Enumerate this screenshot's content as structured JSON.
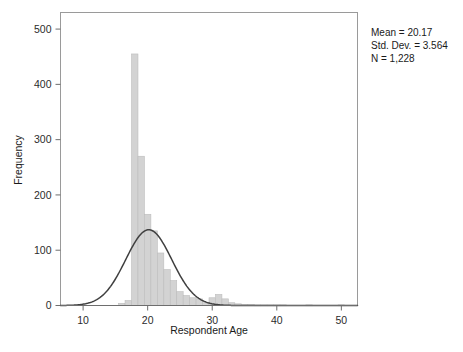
{
  "chart_data": {
    "type": "bar",
    "title": "",
    "subtitle": "",
    "xlabel": "Respondent Age",
    "ylabel": "Frequency",
    "xlim": [
      6.5,
      52.5
    ],
    "ylim": [
      0,
      530
    ],
    "xticks": [
      10,
      20,
      30,
      40,
      50
    ],
    "xtick_labels": [
      "10",
      "20",
      "30",
      "40",
      "50"
    ],
    "yticks": [
      0,
      100,
      200,
      300,
      400,
      500
    ],
    "ytick_labels": [
      "0",
      "100",
      "200",
      "300",
      "400",
      "500"
    ],
    "grid": false,
    "legend": null,
    "bin_width": 1,
    "bar_color": "#d3d3d3",
    "bar_edge_color": "#bdbdbd",
    "curve_color": "#404040",
    "categories": [
      16,
      17,
      18,
      19,
      20,
      21,
      22,
      23,
      24,
      25,
      26,
      27,
      28,
      29,
      30,
      31,
      32,
      33,
      34,
      35,
      36,
      37,
      38,
      39,
      40,
      41,
      42,
      43,
      44,
      45,
      46,
      47,
      48,
      49,
      50
    ],
    "values": [
      4,
      9,
      455,
      270,
      165,
      135,
      95,
      65,
      45,
      25,
      18,
      14,
      12,
      5,
      14,
      20,
      12,
      5,
      3,
      2,
      2,
      1,
      1,
      1,
      1,
      1,
      0,
      0,
      0,
      1,
      0,
      0,
      0,
      0,
      1
    ],
    "overlay": {
      "type": "line",
      "name": "normal-curve",
      "mean": 20.17,
      "std_dev": 3.564,
      "n": 1228,
      "peak_value": 137,
      "peak_x": 20.17
    },
    "annotations": {
      "mean_label": "Mean = 20.17",
      "std_label": "Std. Dev. = 3.564",
      "n_label": "N = 1,228"
    }
  },
  "stats_box": {
    "mean": "Mean = 20.17",
    "std_dev": "Std. Dev. = 3.564",
    "n": "N = 1,228"
  },
  "axes": {
    "x_title": "Respondent Age",
    "y_title": "Frequency"
  }
}
